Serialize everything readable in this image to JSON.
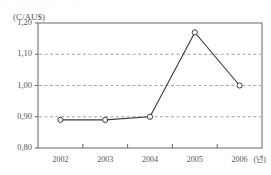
{
  "figure": {
    "top_fragment_text": "· · · · · · · ·",
    "y_unit_label": "(C/AU$)",
    "x_unit_label": "(년)"
  },
  "chart_data": {
    "type": "line",
    "title": "",
    "subtitle": "",
    "xlabel": "(년)",
    "ylabel": "(C/AU$)",
    "categories": [
      "2002",
      "2003",
      "2004",
      "2005",
      "2006"
    ],
    "x": [
      2002,
      2003,
      2004,
      2005,
      2006
    ],
    "series": [
      {
        "name": "C/AU$",
        "values": [
          0.89,
          0.89,
          0.9,
          1.17,
          1.0
        ],
        "marker": "open-circle",
        "line_color": "#3a3a3a",
        "marker_face_color": "#ffffff"
      }
    ],
    "ylim": [
      0.8,
      1.2
    ],
    "yticks": [
      0.8,
      0.9,
      1.0,
      1.1,
      1.2
    ],
    "ytick_labels": [
      "0,80",
      "0,90",
      "1,00",
      "1,10",
      "1,20"
    ],
    "xtick_labels": [
      "2002",
      "2003",
      "2004",
      "2005",
      "2006"
    ],
    "grid": true,
    "grid_axis": "y",
    "grid_style": "dashed",
    "grid_values": [
      0.9,
      1.0,
      1.1
    ],
    "legend": false,
    "legend_position": "none",
    "annotations": []
  },
  "axis_geometry": {
    "plot_left": 38,
    "plot_right": 262,
    "plot_top": 23,
    "plot_bottom": 148
  }
}
